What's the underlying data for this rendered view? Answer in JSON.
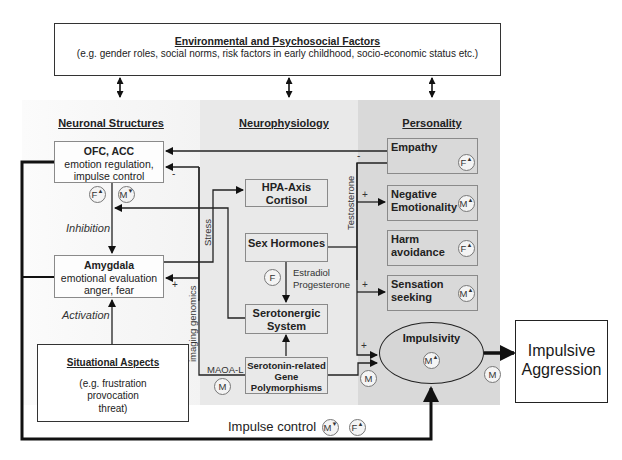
{
  "environment": {
    "title": "Environmental and Psychosocial Factors",
    "subtitle": "(e.g. gender roles, social norms, risk factors in early childhood, socio-economic status etc.)"
  },
  "columns": {
    "neuronal": "Neuronal Structures",
    "neurophysiology": "Neurophysiology",
    "personality": "Personality"
  },
  "neuronal": {
    "ofc": {
      "title": "OFC, ACC",
      "line1": "emotion regulation,",
      "line2": "impulse control"
    },
    "amygdala": {
      "title": "Amygdala",
      "line1": "emotional evaluation",
      "line2": "anger, fear"
    },
    "situational": {
      "title": "Situational Aspects",
      "line1": "(e.g. frustration",
      "line2": "provocation",
      "line3": "threat)"
    },
    "inhibition": "Inhibition",
    "activation": "Activation"
  },
  "neurophysiology": {
    "hpa": {
      "line1": "HPA-Axis",
      "line2": "Cortisol"
    },
    "sex_hormones": "Sex Hormones",
    "serotonergic": {
      "line1": "Serotonergic",
      "line2": "System"
    },
    "serotonin_genes": {
      "line1": "Serotonin-related",
      "line2": "Gene",
      "line3": "Polymorphisms"
    },
    "estradiol": "Estradiol",
    "progesterone": "Progesterone",
    "stress": "Stress",
    "imaging_genomics": "imaging genomics",
    "testosterone": "Testosterone",
    "maoa": "MAOA-L"
  },
  "personality": {
    "empathy": {
      "line1": "Empathy",
      "marker": "F",
      "dir": "▲"
    },
    "negative_emotionality": {
      "line1": "Negative",
      "line2": "Emotionality",
      "marker": "M",
      "dir": "▲"
    },
    "harm_avoidance": {
      "line1": "Harm",
      "line2": "avoidance",
      "marker": "F",
      "dir": "▲"
    },
    "sensation_seeking": {
      "line1": "Sensation",
      "line2": "seeking",
      "marker": "M",
      "dir": "▲"
    },
    "impulsivity": {
      "label": "Impulsivity",
      "marker": "M",
      "dir": "▲"
    }
  },
  "outcome": {
    "line1": "Impulsive",
    "line2": "Aggression"
  },
  "impulse_control": {
    "label": "Impulse control",
    "marker_m": "M",
    "dir_m": "▼",
    "marker_f": "F",
    "dir_f": "▲"
  },
  "markers": {
    "ofc_f": {
      "letter": "F",
      "dir": "▲"
    },
    "ofc_m": {
      "letter": "M",
      "dir": "▼"
    },
    "sex_f": {
      "letter": "F"
    },
    "maoa_m": {
      "letter": "M"
    },
    "gene_m": {
      "letter": "M"
    },
    "outcome_m": {
      "letter": "M"
    }
  },
  "signs": {
    "minus": "-",
    "plus": "+"
  }
}
